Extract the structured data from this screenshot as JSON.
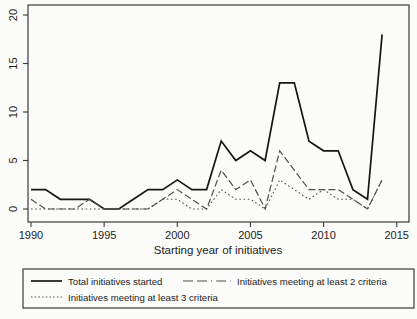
{
  "figure": {
    "background_color": "#fbfbf9",
    "axis_color": "#3a3a3a",
    "text_color": "#1c1c1c"
  },
  "chart_data": {
    "type": "line",
    "title": "",
    "xlabel": "Starting year of initiatives",
    "ylabel": "",
    "xlim": [
      1990,
      2015
    ],
    "ylim": [
      0,
      20
    ],
    "x_ticks": [
      1990,
      1995,
      2000,
      2005,
      2010,
      2015
    ],
    "y_ticks": [
      0,
      5,
      10,
      15,
      20
    ],
    "grid": false,
    "legend_position": "bottom-box",
    "x": [
      1990,
      1991,
      1992,
      1993,
      1994,
      1995,
      1996,
      1997,
      1998,
      1999,
      2000,
      2001,
      2002,
      2003,
      2004,
      2005,
      2006,
      2007,
      2008,
      2009,
      2010,
      2011,
      2012,
      2013,
      2014
    ],
    "series": [
      {
        "name": "Total initiatives started",
        "style": "solid",
        "color": "#161616",
        "values": [
          2,
          2,
          1,
          1,
          1,
          0,
          0,
          1,
          2,
          2,
          3,
          2,
          2,
          7,
          5,
          6,
          5,
          13,
          13,
          7,
          6,
          6,
          2,
          1,
          18
        ]
      },
      {
        "name": "Initiatives meeting at least 2 criteria",
        "style": "longdash",
        "color": "#4f4f4f",
        "values": [
          1,
          0,
          0,
          0,
          1,
          0,
          0,
          0,
          0,
          1,
          2,
          1,
          0,
          4,
          2,
          3,
          0,
          6,
          4,
          2,
          2,
          2,
          1,
          0,
          3
        ]
      },
      {
        "name": "Initiatives meeting at least 3 criteria",
        "style": "dotted",
        "color": "#4f4f4f",
        "values": [
          0,
          0,
          0,
          0,
          0,
          0,
          0,
          0,
          0,
          1,
          1,
          0,
          0,
          2,
          1,
          1,
          0,
          3,
          2,
          1,
          2,
          1,
          1,
          0,
          3
        ]
      }
    ]
  }
}
